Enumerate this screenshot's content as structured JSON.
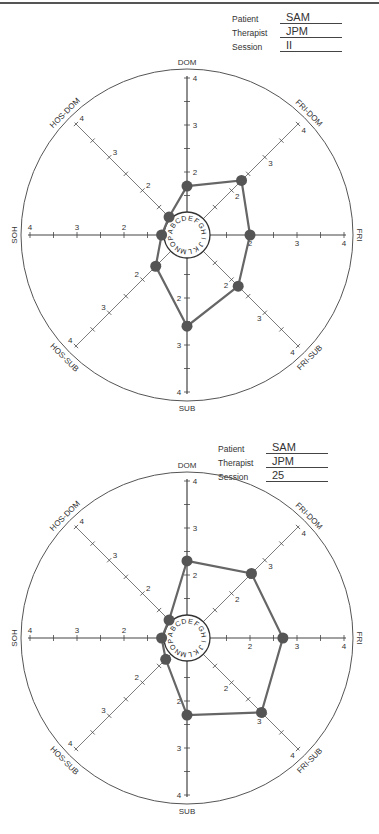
{
  "charts": [
    {
      "patient_label": "Patient",
      "patient": "SAM",
      "therapist_label": "Therapist",
      "therapist": "JPM",
      "session_label": "Session",
      "session": "II"
    },
    {
      "patient_label": "Patient",
      "patient": "SAM",
      "therapist_label": "Therapist",
      "therapist": "JPM",
      "session_label": "Session",
      "session": "25"
    }
  ],
  "axes": [
    "DOM",
    "FRI-DOM",
    "FRI",
    "FRI-SUB",
    "SUB",
    "HOS-SUB",
    "SOH",
    "HOS-DOM"
  ],
  "center_letters": "ABCDEFGHIJKLMNOP",
  "colors": {
    "line": "#666666",
    "point": "#555555",
    "axis": "#444444"
  },
  "chart_data": [
    {
      "type": "radar",
      "title": "Patient SAM, Therapist JPM, Session II",
      "categories": [
        "DOM",
        "FRI-DOM",
        "FRI",
        "FRI-SUB",
        "SUB",
        "HOS-SUB",
        "SOH",
        "HOS-DOM"
      ],
      "values": [
        1.7,
        2.3,
        2.0,
        2.2,
        2.6,
        1.6,
        1.2,
        1.2
      ],
      "axis_range": [
        1,
        4
      ],
      "ticks": [
        2,
        3,
        4
      ]
    },
    {
      "type": "radar",
      "title": "Patient SAM, Therapist JPM, Session 25",
      "categories": [
        "DOM",
        "FRI-DOM",
        "FRI",
        "FRI-SUB",
        "SUB",
        "HOS-SUB",
        "SOH",
        "HOS-DOM"
      ],
      "values": [
        2.3,
        2.6,
        2.7,
        2.9,
        2.3,
        1.3,
        1.2,
        1.2
      ],
      "axis_range": [
        1,
        4
      ],
      "ticks": [
        2,
        3,
        4
      ]
    }
  ]
}
